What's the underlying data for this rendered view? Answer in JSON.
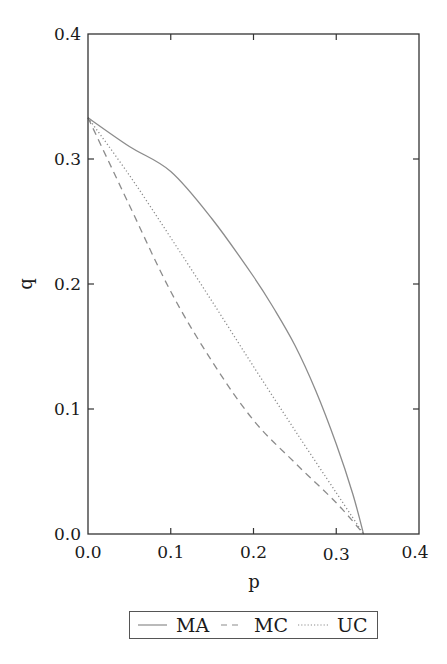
{
  "chart_data": {
    "type": "line",
    "title": "",
    "xlabel": "p",
    "ylabel": "q",
    "xlim": [
      0.0,
      0.4
    ],
    "ylim": [
      0.0,
      0.4
    ],
    "xticks": [
      "0.0",
      "0.1",
      "0.2",
      "0.3",
      "0.4"
    ],
    "yticks": [
      "0.0",
      "0.1",
      "0.2",
      "0.3",
      "0.4"
    ],
    "grid": false,
    "legend_position": "bottom-center-outside",
    "series": [
      {
        "name": "MA",
        "style": "solid",
        "color": "#8c8c8c",
        "points": [
          [
            0.0,
            0.333
          ],
          [
            0.05,
            0.31
          ],
          [
            0.1,
            0.29
          ],
          [
            0.15,
            0.252
          ],
          [
            0.2,
            0.206
          ],
          [
            0.225,
            0.18
          ],
          [
            0.25,
            0.151
          ],
          [
            0.275,
            0.115
          ],
          [
            0.3,
            0.072
          ],
          [
            0.32,
            0.032
          ],
          [
            0.333,
            0.0
          ]
        ]
      },
      {
        "name": "MC",
        "style": "dashed",
        "color": "#8c8c8c",
        "points": [
          [
            0.0,
            0.333
          ],
          [
            0.05,
            0.263
          ],
          [
            0.1,
            0.194
          ],
          [
            0.15,
            0.138
          ],
          [
            0.2,
            0.091
          ],
          [
            0.25,
            0.057
          ],
          [
            0.3,
            0.025
          ],
          [
            0.333,
            0.0
          ]
        ]
      },
      {
        "name": "UC",
        "style": "dotted",
        "color": "#8c8c8c",
        "points": [
          [
            0.0,
            0.333
          ],
          [
            0.05,
            0.287
          ],
          [
            0.1,
            0.237
          ],
          [
            0.15,
            0.186
          ],
          [
            0.2,
            0.134
          ],
          [
            0.25,
            0.083
          ],
          [
            0.3,
            0.033
          ],
          [
            0.333,
            0.0
          ]
        ]
      }
    ]
  },
  "axes": {
    "x_label": "p",
    "y_label": "q",
    "x_ticks": [
      "0.0",
      "0.1",
      "0.2",
      "0.3",
      "0.4"
    ],
    "y_ticks": [
      "0.0",
      "0.1",
      "0.2",
      "0.3",
      "0.4"
    ]
  },
  "legend": {
    "items": [
      {
        "label": "MA",
        "style": "solid"
      },
      {
        "label": "MC",
        "style": "dashed"
      },
      {
        "label": "UC",
        "style": "dotted"
      }
    ]
  },
  "colors": {
    "frame": "#333333",
    "series": "#8c8c8c",
    "text": "#1a1a1a"
  }
}
